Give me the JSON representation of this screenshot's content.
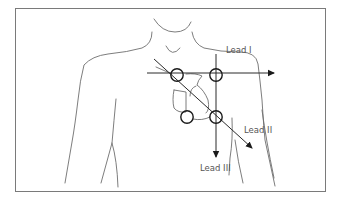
{
  "figure": {
    "labels": {
      "lead_1": "Lead I",
      "lead_2": "Lead II",
      "lead_3": "Lead III"
    },
    "electrodes": [
      "right-arm",
      "left-arm",
      "right-leg",
      "left-leg"
    ],
    "colors": {
      "outline": "#6e6e6e",
      "axis": "#2a2a2a",
      "label": "#555555"
    }
  }
}
